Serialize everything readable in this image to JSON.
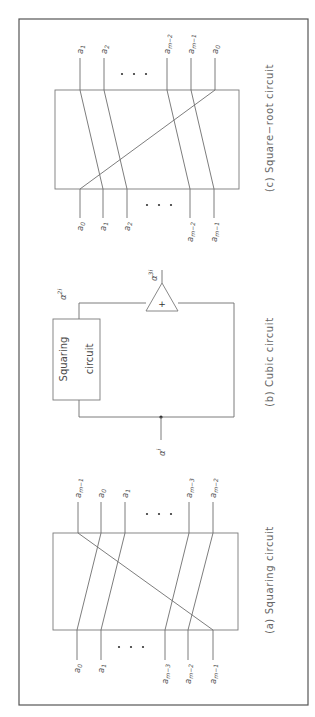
{
  "figure": {
    "orientation": "rotated 90deg counter-clockwise",
    "panels": {
      "a": {
        "caption": "(a)  Squaring  circuit",
        "inputs": [
          {
            "base": "a",
            "sub": "0"
          },
          {
            "base": "a",
            "sub": "1"
          },
          {
            "base": "a",
            "sub": "m−3"
          },
          {
            "base": "a",
            "sub": "m−2"
          },
          {
            "base": "a",
            "sub": "m−1"
          }
        ],
        "outputs": [
          {
            "base": "a",
            "sub": "m−1"
          },
          {
            "base": "a",
            "sub": "0"
          },
          {
            "base": "a",
            "sub": "1"
          },
          {
            "base": "a",
            "sub": "m−3"
          },
          {
            "base": "a",
            "sub": "m−2"
          }
        ],
        "ellipsis": "•  •  •"
      },
      "b": {
        "caption": "(b)  Cubic  circuit",
        "block_line1": "Squaring",
        "block_line2": "circuit",
        "input_label": {
          "base": "α",
          "sup": "i"
        },
        "square_label": {
          "base": "α",
          "sup": "2i"
        },
        "output_label": {
          "base": "α",
          "sup": "3i"
        },
        "adder_symbol": "+"
      },
      "c": {
        "caption": "(c)  Square−root  circuit",
        "inputs": [
          {
            "base": "a",
            "sub": "0"
          },
          {
            "base": "a",
            "sub": "1"
          },
          {
            "base": "a",
            "sub": "2"
          },
          {
            "base": "a",
            "sub": "m−2"
          },
          {
            "base": "a",
            "sub": "m−1"
          }
        ],
        "outputs": [
          {
            "base": "a",
            "sub": "1"
          },
          {
            "base": "a",
            "sub": "2"
          },
          {
            "base": "a",
            "sub": "m−2"
          },
          {
            "base": "a",
            "sub": "m−1"
          },
          {
            "base": "a",
            "sub": "0"
          }
        ],
        "ellipsis": "•  •  •"
      }
    }
  }
}
